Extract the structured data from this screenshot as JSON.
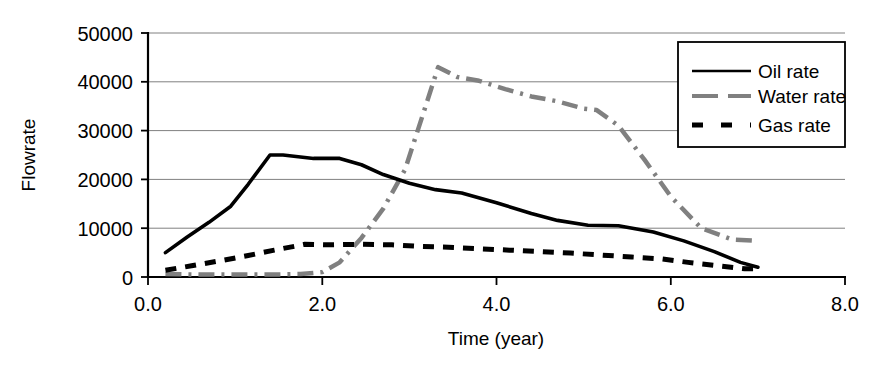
{
  "chart_data": {
    "type": "line",
    "title": "",
    "xlabel": "Time (year)",
    "ylabel": "Flowrate",
    "xlim": [
      0.0,
      8.0
    ],
    "ylim": [
      0,
      50000
    ],
    "xticks": [
      "0.0",
      "2.0",
      "4.0",
      "6.0",
      "8.0"
    ],
    "xtick_values": [
      0.0,
      2.0,
      4.0,
      6.0,
      8.0
    ],
    "yticks": [
      "0",
      "10000",
      "20000",
      "30000",
      "40000",
      "50000"
    ],
    "ytick_values": [
      0,
      10000,
      20000,
      30000,
      40000,
      50000
    ],
    "grid": "horizontal",
    "legend_position": "top-right",
    "series": [
      {
        "name": "Oil rate",
        "style": "solid",
        "color": "#000000",
        "x": [
          0.2,
          0.45,
          0.7,
          0.95,
          1.15,
          1.4,
          1.55,
          1.9,
          2.2,
          2.45,
          2.7,
          3.0,
          3.3,
          3.6,
          4.0,
          4.4,
          4.7,
          5.05,
          5.4,
          5.8,
          6.15,
          6.5,
          6.8,
          7.0
        ],
        "y": [
          5000,
          8200,
          11200,
          14500,
          19000,
          25000,
          25000,
          24300,
          24300,
          23000,
          21000,
          19200,
          17900,
          17200,
          15200,
          13000,
          11600,
          10600,
          10500,
          9200,
          7400,
          5200,
          3000,
          2000
        ]
      },
      {
        "name": "Water rate",
        "style": "dashdot",
        "color": "#808080",
        "x": [
          0.2,
          0.6,
          1.0,
          1.4,
          1.75,
          2.0,
          2.2,
          2.45,
          2.7,
          2.95,
          3.15,
          3.33,
          3.55,
          3.8,
          4.1,
          4.4,
          4.7,
          5.0,
          5.15,
          5.4,
          5.7,
          6.0,
          6.35,
          6.7,
          7.0
        ],
        "y": [
          600,
          500,
          500,
          500,
          600,
          1000,
          3000,
          8000,
          14000,
          22000,
          33000,
          43000,
          41000,
          40200,
          38500,
          37000,
          36000,
          34500,
          34200,
          31000,
          24000,
          16500,
          10000,
          7700,
          7400
        ]
      },
      {
        "name": "Gas rate",
        "style": "dashed",
        "color": "#000000",
        "x": [
          0.2,
          0.5,
          0.85,
          1.15,
          1.45,
          1.8,
          2.1,
          2.45,
          2.8,
          3.1,
          3.45,
          3.8,
          4.15,
          4.5,
          4.85,
          5.2,
          5.55,
          5.9,
          6.2,
          6.55,
          6.85,
          7.0
        ],
        "y": [
          1400,
          2300,
          3400,
          4400,
          5500,
          6700,
          6600,
          6700,
          6600,
          6300,
          6100,
          5800,
          5500,
          5200,
          4900,
          4500,
          4100,
          3700,
          3000,
          2300,
          1700,
          1700
        ]
      }
    ]
  },
  "legend": {
    "items": [
      {
        "label": "Oil rate",
        "swatch": "solid-line-swatch"
      },
      {
        "label": "Water rate",
        "swatch": "dashdot-line-swatch"
      },
      {
        "label": "Gas rate",
        "swatch": "dashed-line-swatch"
      }
    ]
  },
  "axes": {
    "y_title": "Flowrate",
    "x_title": "Time (year)",
    "y_tick_labels": [
      "50000",
      "40000",
      "30000",
      "20000",
      "10000",
      "0"
    ],
    "x_tick_labels": [
      "0.0",
      "2.0",
      "4.0",
      "6.0",
      "8.0"
    ]
  },
  "colors": {
    "oil": "#000000",
    "water": "#808080",
    "gas": "#000000",
    "grid": "#808080",
    "axis": "#000000",
    "background": "#ffffff"
  }
}
